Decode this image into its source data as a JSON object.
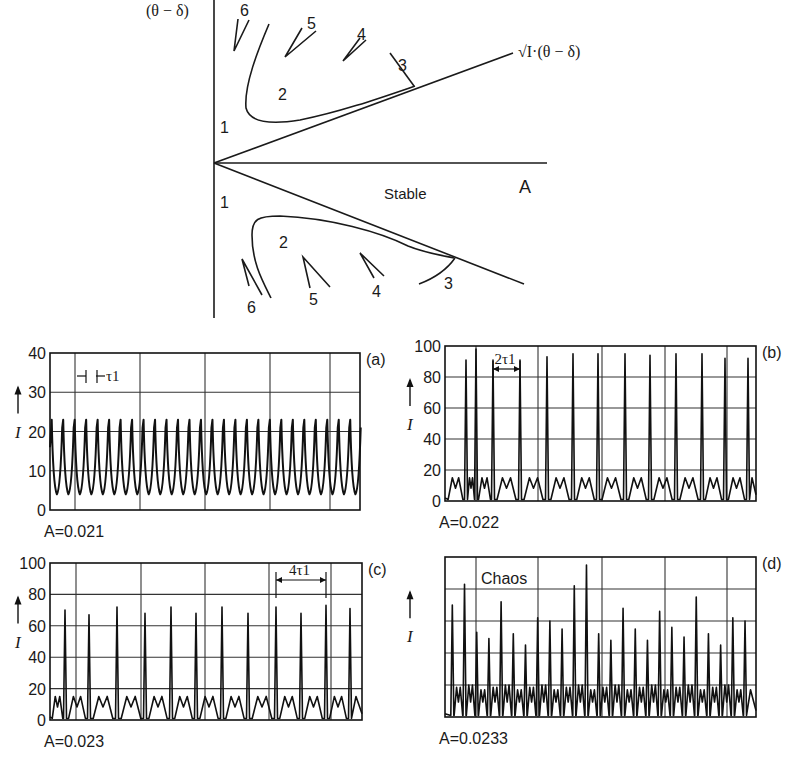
{
  "diagram": {
    "y_axis_label": "(θ − δ)",
    "x_axis_label": "A",
    "boundary_label": "√I·(θ − δ)",
    "stable_label": "Stable",
    "region_labels": [
      "1",
      "2",
      "3",
      "4",
      "5",
      "6"
    ]
  },
  "chart_data": [
    {
      "id": "a",
      "type": "line",
      "panel_label": "(a)",
      "caption": "A=0.021",
      "ylabel": "I",
      "ylim": [
        0,
        40
      ],
      "yticks": [
        0,
        10,
        20,
        30,
        40
      ],
      "annotation": "τ1",
      "annotation_kind": "period",
      "description": "Period-1 oscillation: regular peaks of I ≈ 23 with troughs ≈ 4",
      "peak_count": 27,
      "peak_value": 23,
      "trough_value": 4
    },
    {
      "id": "b",
      "type": "line",
      "panel_label": "(b)",
      "caption": "A=0.022",
      "ylabel": "I",
      "ylim": [
        0,
        100
      ],
      "yticks": [
        0,
        20,
        40,
        60,
        80,
        100
      ],
      "annotation": "2τ1",
      "annotation_kind": "period",
      "description": "Period-2 oscillation: tall spikes ≈ 90–95 alternating with M-shaped low bursts ≈ 15",
      "spike_values": [
        91,
        98,
        91,
        91,
        93,
        95,
        95,
        95,
        94,
        95,
        95,
        92,
        92
      ],
      "low_burst_value": 15
    },
    {
      "id": "c",
      "type": "line",
      "panel_label": "(c)",
      "caption": "A=0.023",
      "ylabel": "I",
      "ylim": [
        0,
        100
      ],
      "yticks": [
        0,
        20,
        40,
        60,
        80,
        100
      ],
      "annotation": "4τ1",
      "annotation_kind": "period",
      "description": "Period-4 oscillation: spikes alternating ≈ 67–72 with low bursts ≈ 15",
      "spike_values": [
        70,
        67,
        72,
        68,
        72,
        68,
        72,
        68,
        72,
        68,
        73,
        71
      ],
      "low_burst_value": 15
    },
    {
      "id": "d",
      "type": "line",
      "panel_label": "(d)",
      "caption": "A=0.0233",
      "ylabel": "I",
      "ylim": [
        0,
        100
      ],
      "yticks": [],
      "annotation": "Chaos",
      "annotation_kind": "label",
      "description": "Chaotic oscillation: irregular spike heights with noisy low bursts",
      "spike_values": [
        70,
        83,
        53,
        49,
        72,
        52,
        45,
        62,
        60,
        55,
        82,
        95,
        52,
        48,
        68,
        55,
        48,
        66,
        56,
        50,
        75,
        52,
        45,
        62,
        60
      ],
      "low_burst_value": 17
    }
  ]
}
